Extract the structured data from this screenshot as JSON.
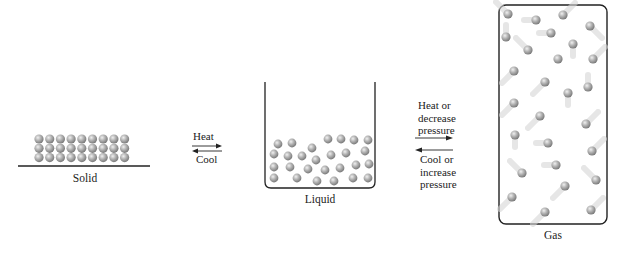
{
  "diagram": {
    "title": "",
    "states": [
      {
        "id": "solid",
        "label": "Solid"
      },
      {
        "id": "liquid",
        "label": "Liquid"
      },
      {
        "id": "gas",
        "label": "Gas"
      }
    ],
    "transitions": [
      {
        "from": "solid",
        "to": "liquid",
        "forward_label": "Heat",
        "reverse_label": "Cool"
      },
      {
        "from": "liquid",
        "to": "gas",
        "forward_label_lines": [
          "Heat or",
          "decrease",
          "pressure"
        ],
        "reverse_label_lines": [
          "Cool or",
          "increase",
          "pressure"
        ]
      }
    ],
    "colors": {
      "particle_light": "#e6e6e6",
      "particle_mid": "#a8a8a8",
      "particle_dark": "#6e6e6e",
      "outline": "#222222",
      "text": "#222222"
    }
  }
}
